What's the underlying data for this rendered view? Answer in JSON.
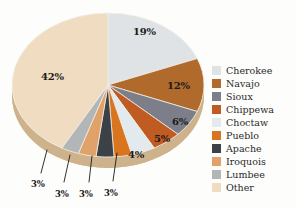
{
  "chart_data": {
    "type": "pie",
    "title": "",
    "subtitle": "",
    "xlabel": "",
    "ylabel": "",
    "legend_position": "right",
    "grid": false,
    "three_d": true,
    "categories": [
      "Cherokee",
      "Navajo",
      "Sioux",
      "Chippewa",
      "Choctaw",
      "Pueblo",
      "Apache",
      "Iroquois",
      "Lumbee",
      "Other"
    ],
    "values": [
      19,
      12,
      6,
      5,
      4,
      3,
      3,
      3,
      3,
      42
    ],
    "value_labels": [
      "19%",
      "12%",
      "6%",
      "5%",
      "4%",
      "3%",
      "3%",
      "3%",
      "3%",
      "42%"
    ],
    "colors": [
      "#dfe3e6",
      "#b06a2c",
      "#7c7f8a",
      "#c05c22",
      "#e3eaee",
      "#d9741f",
      "#3c4047",
      "#e0a269",
      "#b3b6b6",
      "#efdcc1"
    ],
    "series": [
      {
        "name": "Share of American Indian population",
        "points": [
          {
            "label": "Cherokee",
            "value": 19,
            "display": "19%",
            "color": "#dfe3e6"
          },
          {
            "label": "Navajo",
            "value": 12,
            "display": "12%",
            "color": "#b06a2c"
          },
          {
            "label": "Sioux",
            "value": 6,
            "display": "6%",
            "color": "#7c7f8a"
          },
          {
            "label": "Chippewa",
            "value": 5,
            "display": "5%",
            "color": "#c05c22"
          },
          {
            "label": "Choctaw",
            "value": 4,
            "display": "4%",
            "color": "#e3eaee"
          },
          {
            "label": "Pueblo",
            "value": 3,
            "display": "3%",
            "color": "#d9741f"
          },
          {
            "label": "Apache",
            "value": 3,
            "display": "3%",
            "color": "#3c4047"
          },
          {
            "label": "Iroquois",
            "value": 3,
            "display": "3%",
            "color": "#e0a269"
          },
          {
            "label": "Lumbee",
            "value": 3,
            "display": "3%",
            "color": "#b3b6b6"
          },
          {
            "label": "Other",
            "value": 42,
            "display": "42%",
            "color": "#efdcc1"
          }
        ]
      }
    ]
  },
  "legend": {
    "items": [
      {
        "label": "Cherokee",
        "color": "#dfe3e6"
      },
      {
        "label": "Navajo",
        "color": "#b06a2c"
      },
      {
        "label": "Sioux",
        "color": "#7c7f8a"
      },
      {
        "label": "Chippewa",
        "color": "#c05c22"
      },
      {
        "label": "Choctaw",
        "color": "#e3eaee"
      },
      {
        "label": "Pueblo",
        "color": "#d9741f"
      },
      {
        "label": "Apache",
        "color": "#3c4047"
      },
      {
        "label": "Iroquois",
        "color": "#e0a269"
      },
      {
        "label": "Lumbee",
        "color": "#b3b6b6"
      },
      {
        "label": "Other",
        "color": "#efdcc1"
      }
    ]
  },
  "pie_labels": [
    {
      "text": "19%",
      "x": 133,
      "y": 27,
      "size": "normal"
    },
    {
      "text": "12%",
      "x": 167,
      "y": 81,
      "size": "normal"
    },
    {
      "text": "6%",
      "x": 172,
      "y": 117,
      "size": "normal"
    },
    {
      "text": "5%",
      "x": 154,
      "y": 134,
      "size": "normal"
    },
    {
      "text": "4%",
      "x": 128,
      "y": 150,
      "size": "normal"
    },
    {
      "text": "42%",
      "x": 41,
      "y": 72,
      "size": "normal"
    },
    {
      "text": "3%",
      "x": 31,
      "y": 180,
      "size": "small"
    },
    {
      "text": "3%",
      "x": 55,
      "y": 190,
      "size": "small"
    },
    {
      "text": "3%",
      "x": 79,
      "y": 190,
      "size": "small"
    },
    {
      "text": "3%",
      "x": 104,
      "y": 189,
      "size": "small"
    }
  ]
}
